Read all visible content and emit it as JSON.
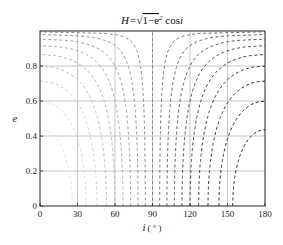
{
  "chart_data": {
    "type": "contour",
    "title_parts": {
      "lhs": "H=",
      "radicand": "1−e",
      "sup": "2",
      "rhs": " cos",
      "var": "i"
    },
    "function": "H = sqrt(1 - e^2) * cos(i)",
    "xlabel": "i ( ° )",
    "xlabel_parts": {
      "var": "i",
      "unit": "( ° )"
    },
    "ylabel": "e",
    "xlim": [
      0,
      180
    ],
    "ylim": [
      0,
      1
    ],
    "xticks": [
      0,
      30,
      60,
      90,
      120,
      150,
      180
    ],
    "yticks": [
      0,
      0.2,
      0.4,
      0.6,
      0.8
    ],
    "ytick_labels": [
      "0",
      "0.2",
      "0.4",
      "0.6",
      "0.8"
    ],
    "xtick_labels": [
      "0",
      "30",
      "60",
      "90",
      "120",
      "150",
      "180"
    ],
    "grid": true,
    "line_style": "dashed",
    "contour_levels": [
      0.9,
      0.8,
      0.7,
      0.6,
      0.5,
      0.4,
      0.3,
      0.2,
      0.1,
      0.0,
      -0.1,
      -0.2,
      -0.3,
      -0.4,
      -0.5,
      -0.6,
      -0.7,
      -0.8,
      -0.9
    ],
    "colormap": "gray: light for positive H, dark for negative H",
    "colors": {
      "light": "#e2e2e2",
      "dark": "#1a1a1a",
      "grid": "#b8b8b8",
      "axes": "#222222"
    }
  }
}
